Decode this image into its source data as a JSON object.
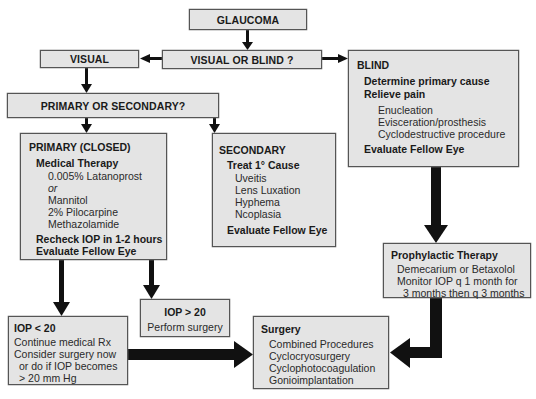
{
  "nodes": {
    "glaucoma": {
      "label": "GLAUCOMA"
    },
    "visual_or_blind": {
      "label": "VISUAL OR BLIND ?"
    },
    "visual": {
      "label": "VISUAL"
    },
    "primary_or_secondary": {
      "label": "PRIMARY OR SECONDARY?"
    },
    "blind": {
      "title": "BLIND",
      "steps": [
        "Determine primary cause",
        "Relieve pain"
      ],
      "options": [
        "Enucleation",
        "Evisceration/prosthesis",
        "Cyclodestructive procedure"
      ],
      "footer": "Evaluate Fellow Eye"
    },
    "primary": {
      "title": "PRIMARY (CLOSED)",
      "subtitle": "Medical Therapy",
      "drugs": [
        "0.005% Latanoprost",
        "or",
        "Mannitol",
        "2% Pilocarpine",
        "Methazolamide"
      ],
      "footer": [
        "Recheck IOP in 1-2 hours",
        "Evaluate Fellow Eye"
      ]
    },
    "secondary": {
      "title": "SECONDARY",
      "subtitle": "Treat 1° Cause",
      "causes": [
        "Uveitis",
        "Lens Luxation",
        "Hyphema",
        "Ncoplasia"
      ],
      "footer": "Evaluate Fellow Eye"
    },
    "prophylactic": {
      "title": "Prophylactic Therapy",
      "lines": [
        "Demecarium or Betaxolol",
        "Monitor IOP q 1 month for",
        "3 months then q 3 months"
      ]
    },
    "iop_high": {
      "title": "IOP > 20",
      "text": "Perform surgery"
    },
    "iop_low": {
      "title": "IOP < 20",
      "lines": [
        "Continue medical Rx",
        "Consider surgery now",
        "or do if IOP becomes",
        "> 20 mm Hg"
      ]
    },
    "surgery": {
      "title": "Surgery",
      "procedures": [
        "Combined Procedures",
        "Cyclocryosurgery",
        "Cyclophotocoagulation",
        "Gonioimplantation"
      ]
    }
  },
  "edges": [
    [
      "GLAUCOMA",
      "VISUAL OR BLIND ?"
    ],
    [
      "VISUAL OR BLIND ?",
      "VISUAL"
    ],
    [
      "VISUAL OR BLIND ?",
      "BLIND"
    ],
    [
      "VISUAL",
      "PRIMARY OR SECONDARY?"
    ],
    [
      "PRIMARY OR SECONDARY?",
      "PRIMARY (CLOSED)"
    ],
    [
      "PRIMARY OR SECONDARY?",
      "SECONDARY"
    ],
    [
      "PRIMARY (CLOSED)",
      "IOP < 20"
    ],
    [
      "PRIMARY (CLOSED)",
      "IOP > 20"
    ],
    [
      "IOP < 20",
      "Surgery"
    ],
    [
      "BLIND",
      "Prophylactic Therapy"
    ],
    [
      "Prophylactic Therapy",
      "Surgery"
    ]
  ]
}
